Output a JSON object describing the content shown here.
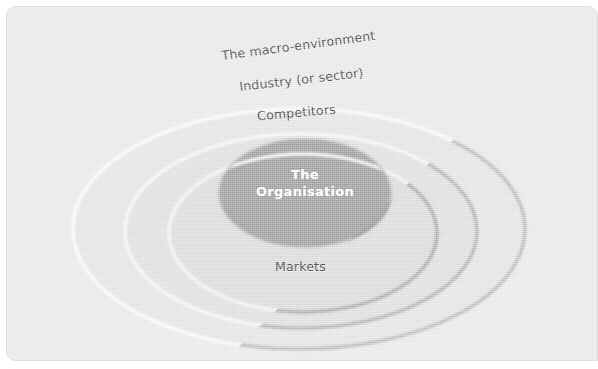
{
  "diagram": {
    "type": "concentric-ellipses",
    "center": {
      "x": 298,
      "y": 228
    },
    "colors": {
      "canvas": "#e9e9e9",
      "ring_outer_fill": "#e3e3e3",
      "ring_mid_fill": "#dedede",
      "ring_inner_fill": "#dadada",
      "core_fill": "#9a9a9a",
      "highlight_stroke": "#fafafa",
      "shadow_stroke": "#a9a9a9",
      "label_text": "#3b3b3b",
      "core_text": "#ffffff"
    },
    "layers": [
      {
        "name": "macro-environment",
        "label": "The macro-environment",
        "rx": 224,
        "ry": 118,
        "order": 1
      },
      {
        "name": "industry",
        "label": "Industry (or sector)",
        "rx": 174,
        "ry": 95,
        "order": 2
      },
      {
        "name": "competitors",
        "label": "Competitors",
        "rx": 133,
        "ry": 77,
        "order": 3
      },
      {
        "name": "markets",
        "label": "Markets",
        "rx": 133,
        "ry": 77,
        "order": 3
      },
      {
        "name": "organisation",
        "label": "The Organisation",
        "rx": 85,
        "ry": 53,
        "order": 4
      }
    ],
    "core": {
      "line1": "The",
      "line2": "Organisation"
    }
  }
}
